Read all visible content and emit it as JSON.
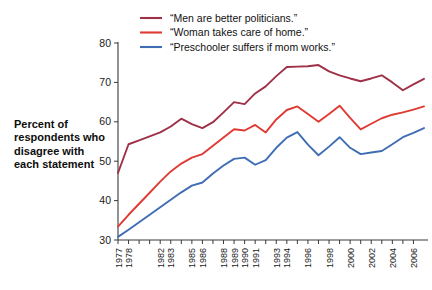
{
  "chart_data": {
    "type": "line",
    "title": "",
    "subtitle": "",
    "xlabel": "",
    "ylabel": "Percent of respondents who disagree with each statement",
    "ylim": [
      30,
      80
    ],
    "yticks": [
      30,
      40,
      50,
      60,
      70,
      80
    ],
    "grid": false,
    "legend_position": "top-center",
    "x_tick_labels": [
      "1977",
      "1978",
      "",
      "",
      "1982",
      "1983",
      "",
      "1985",
      "1986",
      "",
      "1988",
      "1989",
      "1990",
      "1991",
      "",
      "1993",
      "1994",
      "",
      "1996",
      "",
      "1998",
      "",
      "2000",
      "",
      "2002",
      "",
      "2004",
      "",
      "2006"
    ],
    "x": [
      1977,
      1978,
      1979,
      1980,
      1981,
      1982,
      1983,
      1984,
      1985,
      1986,
      1987,
      1988,
      1989,
      1990,
      1991,
      1992,
      1993,
      1994,
      1995,
      1996,
      1997,
      1998,
      1999,
      2000,
      2001,
      2002,
      2003,
      2004,
      2005,
      2006
    ],
    "series": [
      {
        "name": "“Men are better politicians.”",
        "color": "#9e3048",
        "values": [
          47.0,
          54.3,
          55.3,
          56.3,
          57.3,
          58.8,
          60.8,
          59.4,
          58.4,
          59.9,
          62.4,
          65.0,
          64.5,
          67.2,
          69.0,
          71.6,
          73.9,
          74.0,
          74.1,
          74.4,
          72.8,
          71.8,
          71.0,
          70.3,
          71.0,
          71.8,
          70.0,
          68.0,
          69.5,
          70.9
        ]
      },
      {
        "name": "“Woman takes care of home.”",
        "color": "#e03a34",
        "values": [
          33.4,
          36.4,
          39.2,
          42.0,
          44.8,
          47.4,
          49.4,
          50.9,
          51.8,
          53.9,
          56.0,
          58.1,
          57.8,
          59.2,
          57.3,
          60.6,
          63.0,
          63.9,
          62.0,
          60.0,
          62.0,
          64.1,
          61.0,
          58.1,
          59.5,
          60.9,
          61.8,
          62.4,
          63.1,
          63.9
        ]
      },
      {
        "name": "“Preschooler suffers if mom works.”",
        "color": "#3f6db5",
        "values": [
          30.8,
          32.6,
          34.5,
          36.4,
          38.3,
          40.2,
          42.1,
          43.8,
          44.6,
          46.9,
          48.9,
          50.6,
          50.9,
          49.1,
          50.3,
          53.4,
          56.0,
          57.4,
          54.2,
          51.5,
          53.7,
          56.1,
          53.4,
          51.8,
          52.2,
          52.6,
          54.3,
          56.1,
          57.2,
          58.4
        ]
      }
    ]
  },
  "legend": {
    "items": [
      {
        "label": "“Men are better politicians.”",
        "color": "#9e3048"
      },
      {
        "label": "“Woman takes care of home.”",
        "color": "#e03a34"
      },
      {
        "label": "“Preschooler suffers if mom works.”",
        "color": "#3f6db5"
      }
    ]
  },
  "axis_label": {
    "y_caption": "Percent of respondents who disagree with each statement"
  }
}
